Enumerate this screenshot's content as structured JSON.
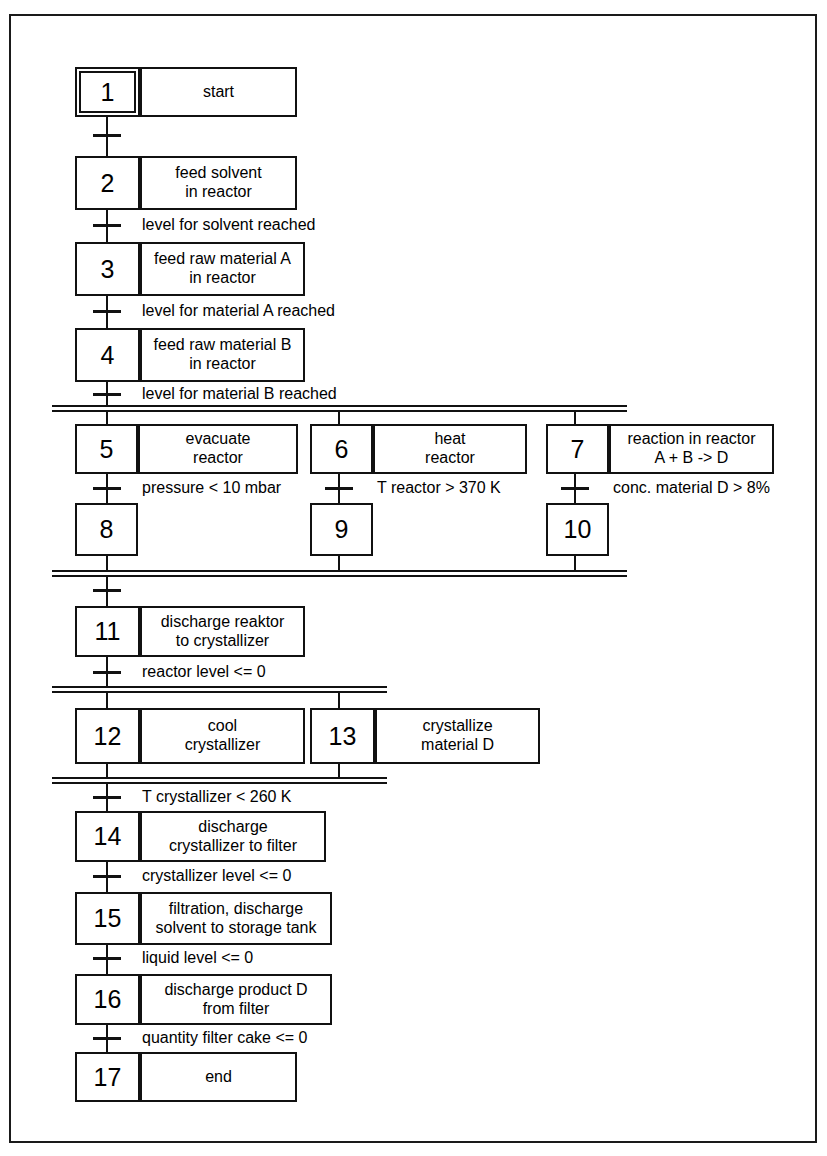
{
  "diagram": {
    "type": "sequential-function-chart",
    "title": "",
    "steps": [
      {
        "id": "1",
        "number": "1",
        "initial": true,
        "action": "start",
        "action_lines": [
          "start"
        ]
      },
      {
        "id": "2",
        "number": "2",
        "initial": false,
        "action": "feed solvent in reactor",
        "action_lines": [
          "feed solvent",
          "in reactor"
        ]
      },
      {
        "id": "3",
        "number": "3",
        "initial": false,
        "action": "feed raw material A in reactor",
        "action_lines": [
          "feed raw material A",
          "in reactor"
        ]
      },
      {
        "id": "4",
        "number": "4",
        "initial": false,
        "action": "feed raw material B in reactor",
        "action_lines": [
          "feed raw material B",
          "in reactor"
        ]
      },
      {
        "id": "5",
        "number": "5",
        "initial": false,
        "action": "evacuate reactor",
        "action_lines": [
          "evacuate",
          "reactor"
        ]
      },
      {
        "id": "6",
        "number": "6",
        "initial": false,
        "action": "heat reactor",
        "action_lines": [
          "heat",
          "reactor"
        ]
      },
      {
        "id": "7",
        "number": "7",
        "initial": false,
        "action": "reaction in reactor A + B -> D",
        "action_lines": [
          "reaction in reactor",
          "A + B -> D"
        ]
      },
      {
        "id": "8",
        "number": "8",
        "initial": false,
        "action": "",
        "action_lines": []
      },
      {
        "id": "9",
        "number": "9",
        "initial": false,
        "action": "",
        "action_lines": []
      },
      {
        "id": "10",
        "number": "10",
        "initial": false,
        "action": "",
        "action_lines": []
      },
      {
        "id": "11",
        "number": "11",
        "initial": false,
        "action": "discharge reaktor to crystallizer",
        "action_lines": [
          "discharge reaktor",
          "to crystallizer"
        ]
      },
      {
        "id": "12",
        "number": "12",
        "initial": false,
        "action": "cool crystallizer",
        "action_lines": [
          "cool",
          "crystallizer"
        ]
      },
      {
        "id": "13",
        "number": "13",
        "initial": false,
        "action": "crystallize material D",
        "action_lines": [
          "crystallize",
          "material D"
        ]
      },
      {
        "id": "14",
        "number": "14",
        "initial": false,
        "action": "discharge crystallizer to filter",
        "action_lines": [
          "discharge",
          "crystallizer to filter"
        ]
      },
      {
        "id": "15",
        "number": "15",
        "initial": false,
        "action": "filtration, discharge solvent to storage tank",
        "action_lines": [
          "filtration, discharge",
          "solvent to storage tank"
        ]
      },
      {
        "id": "16",
        "number": "16",
        "initial": false,
        "action": "discharge product D from filter",
        "action_lines": [
          "discharge product D",
          "from filter"
        ]
      },
      {
        "id": "17",
        "number": "17",
        "initial": false,
        "action": "end",
        "action_lines": [
          "end"
        ]
      }
    ],
    "transitions": [
      {
        "id": "t1",
        "from": "1",
        "to": "2",
        "condition": ""
      },
      {
        "id": "t2",
        "from": "2",
        "to": "3",
        "condition": "level for solvent reached"
      },
      {
        "id": "t3",
        "from": "3",
        "to": "4",
        "condition": "level for material A reached"
      },
      {
        "id": "t4",
        "from": "4",
        "to": "split1",
        "condition": "level for material B reached"
      },
      {
        "id": "t5",
        "from": "5",
        "to": "8",
        "condition": "pressure < 10 mbar"
      },
      {
        "id": "t6",
        "from": "6",
        "to": "9",
        "condition": "T reactor > 370 K"
      },
      {
        "id": "t7",
        "from": "7",
        "to": "10",
        "condition": "conc. material D > 8%"
      },
      {
        "id": "t8",
        "from": "join1",
        "to": "11",
        "condition": ""
      },
      {
        "id": "t9",
        "from": "11",
        "to": "split2",
        "condition": "reactor level <= 0"
      },
      {
        "id": "t10",
        "from": "join2",
        "to": "14",
        "condition": "T crystallizer < 260 K"
      },
      {
        "id": "t11",
        "from": "14",
        "to": "15",
        "condition": "crystallizer level <= 0"
      },
      {
        "id": "t12",
        "from": "15",
        "to": "16",
        "condition": "liquid level <= 0"
      },
      {
        "id": "t13",
        "from": "16",
        "to": "17",
        "condition": "quantity filter cake <= 0"
      }
    ],
    "parallel_branches": [
      {
        "id": "split1",
        "kind": "divergence",
        "branch_steps": [
          "5",
          "6",
          "7"
        ]
      },
      {
        "id": "join1",
        "kind": "convergence",
        "branch_steps": [
          "8",
          "9",
          "10"
        ]
      },
      {
        "id": "split2",
        "kind": "divergence",
        "branch_steps": [
          "12",
          "13"
        ]
      },
      {
        "id": "join2",
        "kind": "convergence",
        "branch_steps": [
          "12",
          "13"
        ]
      }
    ],
    "colors": {
      "line": "#111111",
      "background": "#ffffff",
      "text": "#000000"
    }
  }
}
